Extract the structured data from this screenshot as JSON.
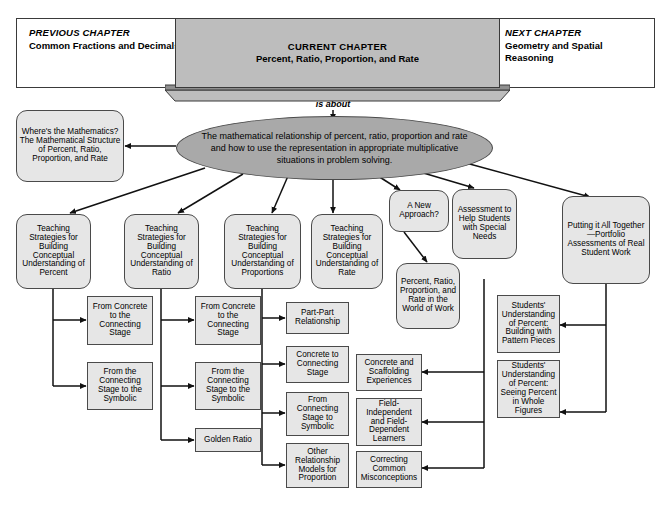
{
  "header": {
    "previous": {
      "kicker": "PREVIOUS CHAPTER",
      "title": "Common Fractions and Decimals"
    },
    "current": {
      "kicker": "CURRENT CHAPTER",
      "title": "Percent, Ratio, Proportion, and Rate"
    },
    "next": {
      "kicker": "NEXT CHAPTER",
      "title": "Geometry and Spatial Reasoning"
    }
  },
  "connector_label": "is about",
  "center": {
    "text": "The mathematical relationship of percent, ratio, proportion and rate and how to use the representation in appropriate multiplicative situations in problem solving."
  },
  "wheres_the_math": {
    "text": "Where's the Mathematics? The Mathematical Structure of Percent, Ratio, Proportion, and Rate"
  },
  "branches": [
    {
      "id": "percent",
      "text": "Teaching Strategies for Building Conceptual Understanding of Percent"
    },
    {
      "id": "ratio",
      "text": "Teaching Strategies for Building Conceptual Understanding of Ratio"
    },
    {
      "id": "proportions",
      "text": "Teaching Strategies for Building Conceptual Understanding of Proportions"
    },
    {
      "id": "rate",
      "text": "Teaching Strategies for Building Conceptual Understanding of Rate"
    },
    {
      "id": "new-approach",
      "text": "A New Approach?"
    },
    {
      "id": "assessment",
      "text": "Assessment to Help Students with Special Needs"
    },
    {
      "id": "portfolio",
      "text": "Putting it All Together—Portfolio Assessments of Real Student Work"
    }
  ],
  "world_of_work": {
    "text": "Percent, Ratio, Proportion, and Rate in the World of Work"
  },
  "percent_children": [
    {
      "text": "From Concrete to the Connecting Stage"
    },
    {
      "text": "From the Connecting Stage to the Symbolic"
    }
  ],
  "ratio_children": [
    {
      "text": "From Concrete to the Connecting Stage"
    },
    {
      "text": "From the Connecting Stage to the Symbolic"
    },
    {
      "text": "Golden Ratio"
    }
  ],
  "proportions_children": [
    {
      "text": "Part-Part Relationship"
    },
    {
      "text": "Concrete to Connecting Stage"
    },
    {
      "text": "From Connecting Stage to Symbolic"
    },
    {
      "text": "Other Relationship Models for Proportion"
    }
  ],
  "assessment_children": [
    {
      "text": "Concrete and Scaffolding Experiences"
    },
    {
      "text": "Field-Independent and Field-Dependent Learners"
    },
    {
      "text": "Correcting Common Misconceptions"
    }
  ],
  "portfolio_children": [
    {
      "text": "Students' Understanding of Percent: Building with Pattern Pieces"
    },
    {
      "text": "Students' Understanding of Percent: Seeing Percent in Whole Figures"
    }
  ],
  "colors": {
    "current_chapter_fill": "#bdbdbd",
    "oval_fill": "#a9a9a9",
    "box_fill": "#e6e6e6",
    "stroke": "#4a4a4a",
    "text": "#000000"
  }
}
